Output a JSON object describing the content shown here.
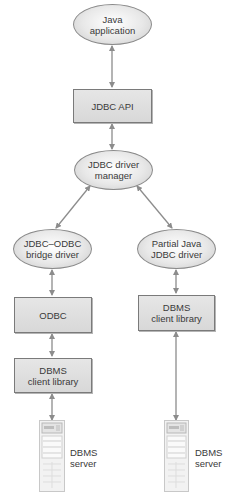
{
  "diagram": {
    "type": "architecture",
    "nodes": {
      "java_app": {
        "label": "Java application",
        "line1": "Java",
        "line2": "application",
        "shape": "ellipse"
      },
      "jdbc_api": {
        "label": "JDBC API",
        "shape": "box"
      },
      "driver_manager": {
        "label": "JDBC driver manager",
        "line1": "JDBC driver",
        "line2": "manager",
        "shape": "ellipse"
      },
      "bridge_driver": {
        "label": "JDBC–ODBC bridge driver",
        "line1": "JDBC–ODBC",
        "line2": "bridge driver",
        "shape": "ellipse"
      },
      "partial_driver": {
        "label": "Partial Java JDBC driver",
        "line1": "Partial Java",
        "line2": "JDBC driver",
        "shape": "ellipse"
      },
      "odbc": {
        "label": "ODBC",
        "shape": "box"
      },
      "client_lib_left": {
        "label": "DBMS client library",
        "line1": "DBMS",
        "line2": "client library",
        "shape": "box"
      },
      "client_lib_right": {
        "label": "DBMS client library",
        "line1": "DBMS",
        "line2": "client library",
        "shape": "box"
      },
      "server_left": {
        "label": "DBMS server",
        "line1": "DBMS",
        "line2": "server",
        "shape": "server-icon"
      },
      "server_right": {
        "label": "DBMS server",
        "line1": "DBMS",
        "line2": "server",
        "shape": "server-icon"
      }
    },
    "edges": [
      {
        "from": "java_app",
        "to": "jdbc_api",
        "arrows": "both"
      },
      {
        "from": "jdbc_api",
        "to": "driver_manager",
        "arrows": "both"
      },
      {
        "from": "driver_manager",
        "to": "bridge_driver",
        "arrows": "both"
      },
      {
        "from": "driver_manager",
        "to": "partial_driver",
        "arrows": "both"
      },
      {
        "from": "bridge_driver",
        "to": "odbc",
        "arrows": "both"
      },
      {
        "from": "odbc",
        "to": "client_lib_left",
        "arrows": "both"
      },
      {
        "from": "client_lib_left",
        "to": "server_left",
        "arrows": "both"
      },
      {
        "from": "partial_driver",
        "to": "client_lib_right",
        "arrows": "both"
      },
      {
        "from": "client_lib_right",
        "to": "server_right",
        "arrows": "both"
      }
    ],
    "colors": {
      "line": "#8c8c8c",
      "box_fill": "#dcdcdc",
      "ellipse_fill": "#e8e8e8",
      "text": "#3a3a3a"
    }
  }
}
